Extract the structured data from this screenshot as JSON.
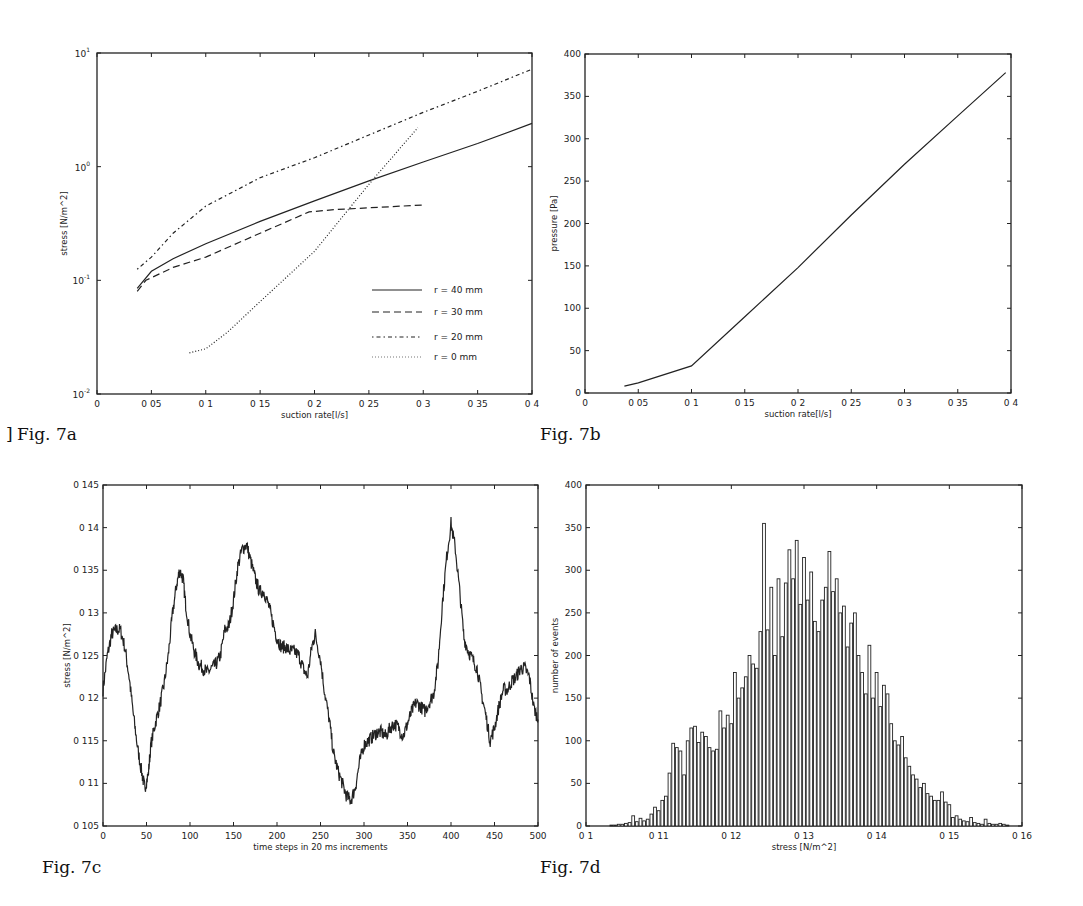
{
  "figures": [
    {
      "id": "fig7a",
      "caption": "Fig. 7a"
    },
    {
      "id": "fig7b",
      "caption": "Fig. 7b"
    },
    {
      "id": "fig7c",
      "caption": "Fig. 7c"
    },
    {
      "id": "fig7d",
      "caption": "Fig. 7d"
    }
  ],
  "chart_data": [
    {
      "id": "fig7a",
      "type": "line",
      "title": "",
      "caption": "Fig. 7a",
      "xlabel": "suction rate[l/s]",
      "ylabel": "stress [N/m^2]",
      "xlim": [
        0,
        0.4
      ],
      "ylim": [
        0.01,
        10
      ],
      "yscale": "log",
      "xticks": [
        0,
        0.05,
        0.1,
        0.15,
        0.2,
        0.25,
        0.3,
        0.35,
        0.4
      ],
      "xtick_labels": [
        "0",
        "0 05",
        "0 1",
        "0 15",
        "0 2",
        "0 25",
        "0 3",
        "0 35",
        "0 4"
      ],
      "yticks": [
        0.01,
        0.1,
        1,
        10
      ],
      "ytick_labels": [
        [
          "10",
          "-2"
        ],
        [
          "10",
          "-1"
        ],
        [
          "10",
          "0"
        ],
        [
          "10",
          "1"
        ]
      ],
      "grid": false,
      "legend_position": "lower right",
      "series": [
        {
          "name": "r = 40 mm",
          "style": "solid",
          "x": [
            0.037,
            0.05,
            0.07,
            0.1,
            0.15,
            0.2,
            0.25,
            0.3,
            0.35,
            0.4
          ],
          "y": [
            0.085,
            0.12,
            0.155,
            0.21,
            0.33,
            0.5,
            0.75,
            1.1,
            1.6,
            2.4
          ]
        },
        {
          "name": "r = 30 mm",
          "style": "dashed",
          "x": [
            0.037,
            0.045,
            0.07,
            0.1,
            0.15,
            0.195,
            0.22,
            0.3
          ],
          "y": [
            0.08,
            0.1,
            0.13,
            0.16,
            0.26,
            0.4,
            0.42,
            0.46
          ]
        },
        {
          "name": "r = 20 mm",
          "style": "dashdot",
          "x": [
            0.037,
            0.05,
            0.07,
            0.1,
            0.15,
            0.2,
            0.25,
            0.3,
            0.35,
            0.4
          ],
          "y": [
            0.125,
            0.16,
            0.26,
            0.45,
            0.8,
            1.2,
            1.9,
            3.0,
            4.6,
            7.2
          ]
        },
        {
          "name": "r = 0 mm",
          "style": "dotted",
          "x": [
            0.085,
            0.1,
            0.12,
            0.15,
            0.2,
            0.25,
            0.295
          ],
          "y": [
            0.023,
            0.025,
            0.035,
            0.065,
            0.18,
            0.7,
            2.2
          ]
        }
      ]
    },
    {
      "id": "fig7b",
      "type": "line",
      "title": "",
      "caption": "Fig. 7b",
      "xlabel": "suction rate[l/s]",
      "ylabel": "pressure [Pa]",
      "xlim": [
        0,
        0.4
      ],
      "ylim": [
        0,
        400
      ],
      "xticks": [
        0,
        0.05,
        0.1,
        0.15,
        0.2,
        0.25,
        0.3,
        0.35,
        0.4
      ],
      "xtick_labels": [
        "0",
        "0 05",
        "0 1",
        "0 15",
        "0 2",
        "0 25",
        "0 3",
        "0 35",
        "0 4"
      ],
      "yticks": [
        0,
        50,
        100,
        150,
        200,
        250,
        300,
        350,
        400
      ],
      "ytick_labels": [
        "0",
        "50",
        "100",
        "150",
        "200",
        "250",
        "300",
        "350",
        "400"
      ],
      "grid": false,
      "series": [
        {
          "name": "pressure",
          "style": "solid",
          "x": [
            0.037,
            0.05,
            0.1,
            0.15,
            0.2,
            0.25,
            0.3,
            0.35,
            0.395
          ],
          "y": [
            8,
            12,
            32,
            90,
            148,
            210,
            270,
            327,
            378
          ]
        }
      ]
    },
    {
      "id": "fig7c",
      "type": "line",
      "title": "",
      "caption": "Fig. 7c",
      "xlabel": "time steps in 20 ms increments",
      "ylabel": "stress [N/m^2]",
      "xlim": [
        0,
        500
      ],
      "ylim": [
        0.105,
        0.145
      ],
      "xticks": [
        0,
        50,
        100,
        150,
        200,
        250,
        300,
        350,
        400,
        450,
        500
      ],
      "xtick_labels": [
        "0",
        "50",
        "100",
        "150",
        "200",
        "250",
        "300",
        "350",
        "400",
        "450",
        "500"
      ],
      "yticks": [
        0.105,
        0.11,
        0.115,
        0.12,
        0.125,
        0.13,
        0.135,
        0.14,
        0.145
      ],
      "ytick_labels": [
        "0 105",
        "0 11",
        "0 115",
        "0 12",
        "0 125",
        "0 13",
        "0 135",
        "0 14",
        "0 145"
      ],
      "grid": false,
      "series": [
        {
          "name": "stress",
          "style": "solid",
          "x": [
            0,
            5,
            10,
            15,
            20,
            25,
            30,
            35,
            40,
            45,
            48,
            52,
            55,
            60,
            65,
            70,
            75,
            80,
            85,
            88,
            92,
            95,
            100,
            105,
            110,
            115,
            120,
            125,
            130,
            135,
            140,
            145,
            150,
            155,
            160,
            165,
            170,
            175,
            180,
            185,
            190,
            195,
            200,
            205,
            210,
            215,
            220,
            225,
            230,
            235,
            240,
            244,
            250,
            255,
            260,
            265,
            270,
            275,
            280,
            285,
            290,
            295,
            300,
            305,
            310,
            315,
            320,
            325,
            330,
            335,
            340,
            345,
            350,
            355,
            360,
            365,
            370,
            375,
            380,
            385,
            390,
            395,
            400,
            405,
            410,
            415,
            420,
            425,
            430,
            435,
            440,
            445,
            450,
            455,
            460,
            465,
            470,
            475,
            480,
            485,
            490,
            495,
            500
          ],
          "y": [
            0.121,
            0.125,
            0.1275,
            0.128,
            0.128,
            0.126,
            0.1225,
            0.118,
            0.114,
            0.111,
            0.1095,
            0.111,
            0.1145,
            0.117,
            0.119,
            0.1215,
            0.125,
            0.13,
            0.1335,
            0.135,
            0.134,
            0.131,
            0.1275,
            0.1255,
            0.124,
            0.1235,
            0.123,
            0.1235,
            0.124,
            0.125,
            0.128,
            0.1285,
            0.1315,
            0.1355,
            0.1375,
            0.138,
            0.136,
            0.134,
            0.1325,
            0.1325,
            0.131,
            0.129,
            0.127,
            0.126,
            0.126,
            0.1255,
            0.1255,
            0.125,
            0.1235,
            0.1225,
            0.126,
            0.1275,
            0.1245,
            0.1205,
            0.1175,
            0.1135,
            0.1115,
            0.11,
            0.1085,
            0.108,
            0.1095,
            0.1125,
            0.1145,
            0.115,
            0.1155,
            0.116,
            0.116,
            0.1155,
            0.1165,
            0.117,
            0.1165,
            0.1155,
            0.117,
            0.1185,
            0.1195,
            0.119,
            0.1185,
            0.1195,
            0.1205,
            0.124,
            0.131,
            0.1365,
            0.1405,
            0.1375,
            0.1325,
            0.127,
            0.1255,
            0.1245,
            0.1235,
            0.1205,
            0.118,
            0.115,
            0.1165,
            0.119,
            0.121,
            0.121,
            0.122,
            0.1225,
            0.1235,
            0.1235,
            0.1225,
            0.119,
            0.1175
          ]
        }
      ]
    },
    {
      "id": "fig7d",
      "type": "bar",
      "title": "",
      "caption": "Fig. 7d",
      "xlabel": "stress [N/m^2]",
      "ylabel": "number of events",
      "xlim": [
        0.1,
        0.16
      ],
      "ylim": [
        0,
        400
      ],
      "xticks": [
        0.1,
        0.11,
        0.12,
        0.13,
        0.14,
        0.15,
        0.16
      ],
      "xtick_labels": [
        "0 1",
        "0 11",
        "0 12",
        "0 13",
        "0 14",
        "0 15",
        "0 16"
      ],
      "yticks": [
        0,
        50,
        100,
        150,
        200,
        250,
        300,
        350,
        400
      ],
      "ytick_labels": [
        "0",
        "50",
        "100",
        "150",
        "200",
        "250",
        "300",
        "350",
        "400"
      ],
      "grid": false,
      "bin_start": 0.1035,
      "bin_width": 0.0005,
      "values": [
        1,
        1,
        2,
        2,
        3,
        4,
        12,
        5,
        9,
        6,
        8,
        14,
        22,
        18,
        30,
        35,
        62,
        97,
        92,
        88,
        60,
        100,
        115,
        117,
        98,
        110,
        105,
        92,
        88,
        90,
        135,
        115,
        130,
        120,
        180,
        150,
        162,
        175,
        200,
        190,
        185,
        228,
        355,
        230,
        280,
        200,
        290,
        222,
        285,
        324,
        290,
        335,
        260,
        315,
        265,
        298,
        240,
        228,
        265,
        280,
        322,
        275,
        290,
        250,
        258,
        210,
        238,
        250,
        200,
        180,
        155,
        212,
        150,
        180,
        140,
        165,
        155,
        120,
        100,
        95,
        105,
        80,
        70,
        60,
        55,
        45,
        50,
        38,
        35,
        30,
        30,
        40,
        28,
        25,
        10,
        12,
        8,
        6,
        5,
        10,
        4,
        3,
        2,
        8,
        3,
        2,
        2,
        3,
        2,
        1
      ]
    }
  ]
}
